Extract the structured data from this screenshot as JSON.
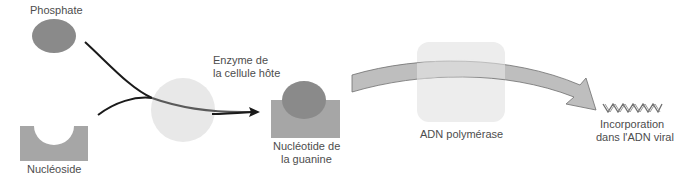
{
  "diagram": {
    "labels": {
      "phosphate": "Phosphate",
      "nucleoside": "Nucléoside",
      "enzyme_line1": "Enzyme de",
      "enzyme_line2": "la cellule hôte",
      "nucleotide_line1": "Nucléotide de",
      "nucleotide_line2": "la guanine",
      "polymerase": "ADN polymérase",
      "incorporation_line1": "Incorporation",
      "incorporation_line2": "dans l'ADN viral"
    },
    "colors": {
      "phosphate": "#8a8a8a",
      "nucleoside": "#a6a6a6",
      "enzyme": "#e8e8e8",
      "polymerase": "#ededed",
      "arrow_band": "#b3b3b3",
      "line": "#1a1a1a",
      "text": "#4d4d4d"
    }
  }
}
